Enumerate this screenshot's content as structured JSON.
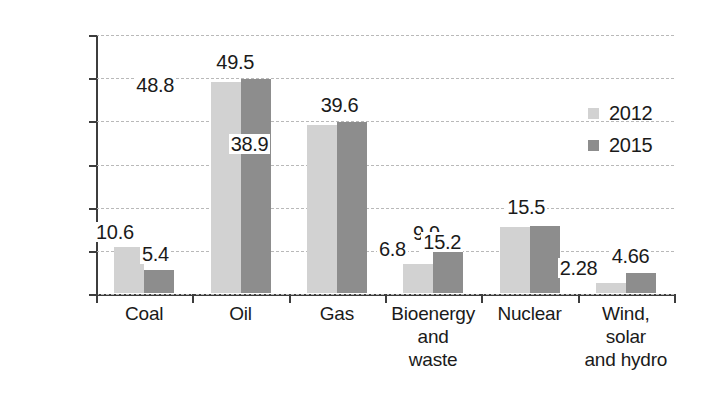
{
  "chart_data": {
    "type": "bar",
    "title": "",
    "xlabel": "",
    "ylabel": "Million tons",
    "ylim": [
      0,
      60
    ],
    "yticks": [
      "0",
      "10",
      "20",
      "30",
      "40",
      "50",
      "60"
    ],
    "grid": true,
    "legend_position": "right",
    "categories": [
      "Coal",
      "Oil",
      "Gas",
      "Bioenergy\nand\nwaste",
      "Nuclear",
      "Wind,\nsolar\nand hydro"
    ],
    "series": [
      {
        "name": "2012",
        "color": "#d2d2d2",
        "values": [
          10.6,
          48.8,
          38.9,
          6.8,
          15.2,
          2.28
        ],
        "labels": [
          "10.6",
          "48.8",
          "38.9",
          "6.8",
          "15.2",
          "2.28"
        ]
      },
      {
        "name": "2015",
        "color": "#8d8d8d",
        "values": [
          5.4,
          49.5,
          39.6,
          9.9,
          15.5,
          4.66
        ],
        "labels": [
          "5.4",
          "49.5",
          "39.6",
          "9.9",
          "15.5",
          "4.66"
        ]
      }
    ]
  },
  "legend": {
    "items": [
      {
        "label": "2012",
        "color": "#d2d2d2"
      },
      {
        "label": "2015",
        "color": "#8d8d8d"
      }
    ]
  },
  "axis": {
    "y_title": "Million tons",
    "y_ticks": [
      "60",
      "50",
      "40",
      "30",
      "20",
      "10",
      "0"
    ]
  }
}
